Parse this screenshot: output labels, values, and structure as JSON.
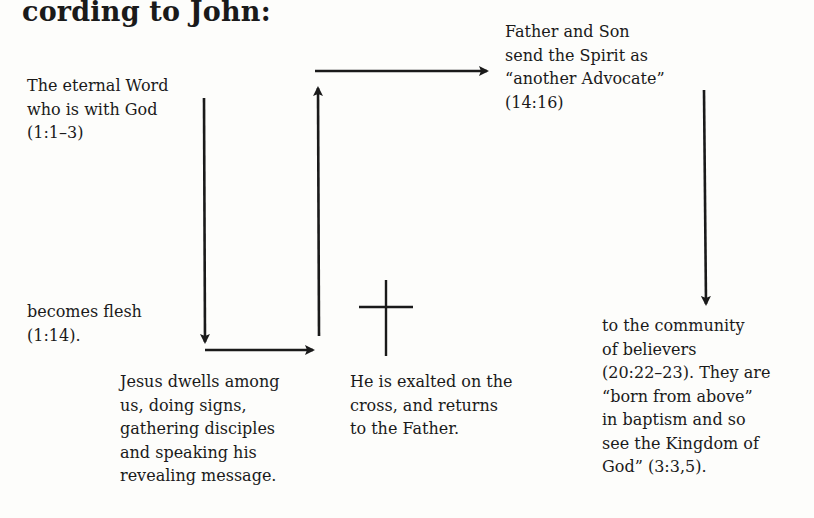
{
  "heading": "cording to John:",
  "nodes": {
    "eternal_word": "The eternal Word\nwho is with God\n(1:1–3)",
    "becomes_flesh": "becomes flesh\n(1:14).",
    "dwells": "Jesus dwells among\nus, doing signs,\ngathering disciples\nand speaking his\nrevealing message.",
    "exalted": "He is exalted on the\ncross, and returns\nto the Father.",
    "father_son": "Father and Son\nsend the Spirit as\n“another Advocate”\n(14:16)",
    "community": "to the community\nof believers\n(20:22–23). They are\n“born from above”\nin baptism and so\nsee the Kingdom of\nGod” (3:3,5)."
  },
  "icons": {
    "cross": "cross-icon"
  },
  "colors": {
    "ink": "#1a1a1a",
    "paper": "#fdfdfb"
  }
}
